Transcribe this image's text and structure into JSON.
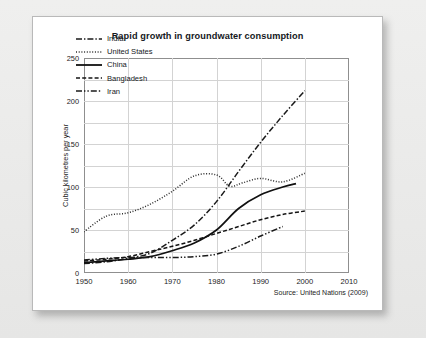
{
  "chart_data": {
    "type": "line",
    "title": "Rapid growth in groundwater consumption",
    "xlabel": "",
    "ylabel": "Cubic kilometres per year",
    "xlim": [
      1950,
      2010
    ],
    "ylim": [
      0,
      250
    ],
    "xticks": [
      "1950",
      "1960",
      "1970",
      "1980",
      "1990",
      "2000",
      "2010"
    ],
    "yticks": [
      "0",
      "50",
      "100",
      "150",
      "200",
      "250"
    ],
    "grid": true,
    "legend_position": "top-left inside plot",
    "source": "Source: United Nations (2009)",
    "series": [
      {
        "name": "India",
        "style": "dash-dot",
        "color": "#1a1a1a",
        "points": [
          [
            1950,
            11
          ],
          [
            1955,
            13
          ],
          [
            1960,
            17
          ],
          [
            1965,
            23
          ],
          [
            1970,
            38
          ],
          [
            1975,
            56
          ],
          [
            1980,
            83
          ],
          [
            1985,
            118
          ],
          [
            1990,
            152
          ],
          [
            1995,
            183
          ],
          [
            2000,
            212
          ]
        ]
      },
      {
        "name": "United States",
        "style": "dotted",
        "color": "#2a2a2a",
        "points": [
          [
            1950,
            48
          ],
          [
            1955,
            66
          ],
          [
            1960,
            70
          ],
          [
            1965,
            80
          ],
          [
            1970,
            95
          ],
          [
            1975,
            113
          ],
          [
            1980,
            114
          ],
          [
            1983,
            101
          ],
          [
            1986,
            105
          ],
          [
            1990,
            110
          ],
          [
            1995,
            106
          ],
          [
            2000,
            116
          ]
        ]
      },
      {
        "name": "China",
        "style": "solid",
        "color": "#111111",
        "points": [
          [
            1950,
            12
          ],
          [
            1955,
            14
          ],
          [
            1960,
            16
          ],
          [
            1965,
            19
          ],
          [
            1970,
            26
          ],
          [
            1975,
            35
          ],
          [
            1980,
            50
          ],
          [
            1985,
            75
          ],
          [
            1990,
            91
          ],
          [
            1995,
            100
          ],
          [
            1998,
            104
          ]
        ]
      },
      {
        "name": "Bangladesh",
        "style": "dashed",
        "color": "#141414",
        "points": [
          [
            1950,
            14
          ],
          [
            1955,
            16
          ],
          [
            1960,
            19
          ],
          [
            1965,
            25
          ],
          [
            1970,
            31
          ],
          [
            1975,
            38
          ],
          [
            1980,
            46
          ],
          [
            1985,
            54
          ],
          [
            1990,
            62
          ],
          [
            1995,
            68
          ],
          [
            2000,
            72
          ]
        ]
      },
      {
        "name": "Iran",
        "style": "dash-dot-dot",
        "color": "#1a1a1a",
        "points": [
          [
            1950,
            15
          ],
          [
            1955,
            17
          ],
          [
            1960,
            18
          ],
          [
            1965,
            18
          ],
          [
            1970,
            18
          ],
          [
            1975,
            19
          ],
          [
            1980,
            22
          ],
          [
            1985,
            31
          ],
          [
            1990,
            43
          ],
          [
            1995,
            54
          ]
        ]
      }
    ]
  }
}
